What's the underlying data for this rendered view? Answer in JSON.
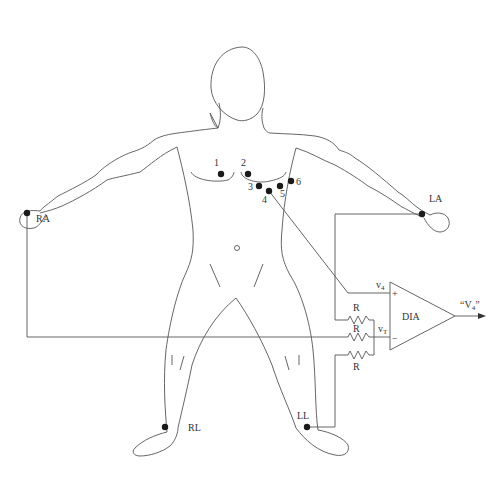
{
  "diagram": {
    "type": "ECG electrode placement with differential instrumentation amplifier",
    "limb_electrodes": [
      {
        "id": "RA",
        "label": "RA",
        "x": 27,
        "y": 213
      },
      {
        "id": "LA",
        "label": "LA",
        "x": 422,
        "y": 214
      },
      {
        "id": "RL",
        "label": "RL",
        "x": 165,
        "y": 427
      },
      {
        "id": "LL",
        "label": "LL",
        "x": 307,
        "y": 427
      }
    ],
    "chest_electrodes": [
      {
        "id": "V1",
        "label": "1",
        "x": 221,
        "y": 174
      },
      {
        "id": "V2",
        "label": "2",
        "x": 248,
        "y": 174
      },
      {
        "id": "V3",
        "label": "3",
        "x": 259,
        "y": 186
      },
      {
        "id": "V4",
        "label": "4",
        "x": 269,
        "y": 191
      },
      {
        "id": "V5",
        "label": "5",
        "x": 280,
        "y": 186
      },
      {
        "id": "V6",
        "label": "6",
        "x": 291,
        "y": 181
      }
    ],
    "amplifier": {
      "label": "DIA",
      "plus_input_label": "v",
      "plus_input_sub": "4",
      "plus_sign": "+",
      "minus_input_label": "v",
      "minus_input_sub": "T",
      "minus_sign": "−",
      "output_label_open": "“V",
      "output_label_sub": "4",
      "output_label_close": "”"
    },
    "resistors": [
      {
        "label": "R"
      },
      {
        "label": "R"
      },
      {
        "label": "R"
      }
    ]
  }
}
